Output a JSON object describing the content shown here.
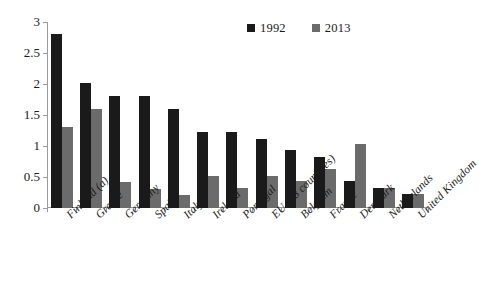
{
  "chart_data": {
    "type": "bar",
    "title": "",
    "xlabel": "",
    "ylabel": "",
    "ylim": [
      0,
      3
    ],
    "yticks": [
      "0",
      "0.5",
      "1",
      "1.5",
      "2",
      "2.5",
      "3"
    ],
    "grid": false,
    "legend_position": "top-right",
    "categories": [
      "Finland (a)",
      "Greece",
      "Germany",
      "Spain",
      "Italy",
      "Ireland",
      "Portugal",
      "EU (28 countries)",
      "Belgium",
      "France",
      "Denmark",
      "Netherlands",
      "United Kingdom"
    ],
    "series": [
      {
        "name": "1992",
        "color": "#1a1a1a",
        "values": [
          2.8,
          2.01,
          1.8,
          1.81,
          1.6,
          1.22,
          1.22,
          1.12,
          0.93,
          0.83,
          0.43,
          0.33,
          0.23
        ]
      },
      {
        "name": "2013",
        "color": "#6b6b6b",
        "values": [
          1.3,
          1.6,
          0.42,
          0.31,
          0.21,
          0.52,
          0.32,
          0.52,
          0.43,
          0.63,
          1.03,
          0.33,
          0.23
        ]
      }
    ]
  },
  "legend": {
    "entries": [
      {
        "label": "1992",
        "color": "#1a1a1a"
      },
      {
        "label": "2013",
        "color": "#6b6b6b"
      }
    ]
  },
  "axis": {
    "y_tick_labels": [
      "3",
      "2.5",
      "2",
      "1.5",
      "1",
      "0.5",
      "0"
    ]
  }
}
